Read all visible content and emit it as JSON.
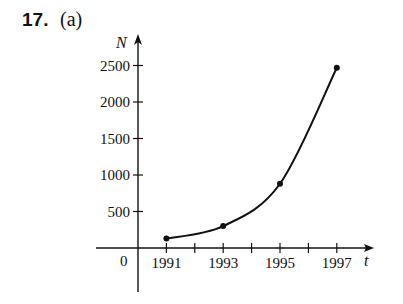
{
  "problem": {
    "number": "17.",
    "part": "(a)"
  },
  "chart_data": {
    "type": "line",
    "title": "",
    "xlabel": "t",
    "ylabel": "N",
    "x": [
      1991,
      1993,
      1995,
      1997
    ],
    "series": [
      {
        "name": "N",
        "values": [
          130,
          300,
          880,
          2470
        ]
      }
    ],
    "x_ticks": [
      1991,
      1992,
      1993,
      1994,
      1995,
      1996,
      1997
    ],
    "x_tick_labels": [
      "1991",
      "1993",
      "1995",
      "1997"
    ],
    "y_ticks": [
      500,
      1000,
      1500,
      2000,
      2500
    ],
    "y_tick_labels": [
      "500",
      "1000",
      "1500",
      "2000",
      "2500"
    ],
    "origin_label": "0",
    "xlim": [
      1990,
      1998.3
    ],
    "ylim": [
      -600,
      2700
    ],
    "grid": false,
    "legend": "none",
    "markers": true,
    "curve": "smooth"
  }
}
